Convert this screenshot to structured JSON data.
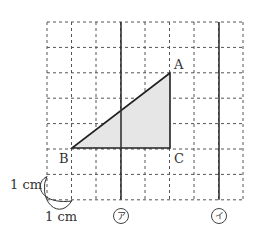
{
  "diagram": {
    "grid": {
      "x0": 47,
      "y0": 22,
      "cols": 8,
      "rows": 7,
      "cell_w": 24.5,
      "cell_h": 25.4,
      "unit": "1 cm"
    },
    "triangle": {
      "fill": "#e6e6e6",
      "vertices": {
        "A": [
          170,
          73
        ],
        "B": [
          72,
          148
        ],
        "C": [
          170,
          148
        ]
      }
    },
    "points": [
      {
        "name": "A",
        "label": "A"
      },
      {
        "name": "B",
        "label": "B"
      },
      {
        "name": "C",
        "label": "C"
      }
    ],
    "lines": [
      {
        "id": "a",
        "label": "ア",
        "x": 121
      },
      {
        "id": "i",
        "label": "イ",
        "x": 219
      }
    ],
    "scale_labels": {
      "vertical": "1 cm",
      "horizontal": "1 cm"
    }
  }
}
